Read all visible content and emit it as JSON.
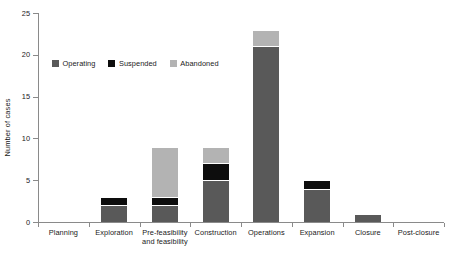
{
  "chart_data": {
    "type": "bar",
    "subtype": "stacked-vertical-bar",
    "title": "",
    "xlabel": "",
    "ylabel": "Number of cases",
    "ylim": [
      0,
      25
    ],
    "yticks": [
      0,
      5,
      10,
      15,
      20,
      25
    ],
    "grid": false,
    "legend_position": "inside upper-left",
    "categories": [
      "Planning",
      "Exploration",
      "Pre-feasibility and feasibility",
      "Construction",
      "Operations",
      "Expansion",
      "Closure",
      "Post-closure"
    ],
    "category_lines": [
      [
        "Planning"
      ],
      [
        "Exploration"
      ],
      [
        "Pre-feasibility",
        "and feasibility"
      ],
      [
        "Construction"
      ],
      [
        "Operations"
      ],
      [
        "Expansion"
      ],
      [
        "Closure"
      ],
      [
        "Post-closure"
      ]
    ],
    "series": [
      {
        "name": "Operating",
        "color": "#595959",
        "values": [
          0,
          2,
          2,
          5,
          21,
          4,
          1,
          0
        ]
      },
      {
        "name": "Suspended",
        "color": "#0d0d0d",
        "values": [
          0,
          1,
          1,
          2,
          0,
          1,
          0,
          0
        ]
      },
      {
        "name": "Abandoned",
        "color": "#b3b3b3",
        "values": [
          0,
          0,
          6,
          2,
          2,
          0,
          0,
          0
        ]
      }
    ],
    "totals": [
      0,
      3,
      9,
      9,
      23,
      5,
      1,
      0
    ],
    "axis_color": "#8a8a8a"
  }
}
